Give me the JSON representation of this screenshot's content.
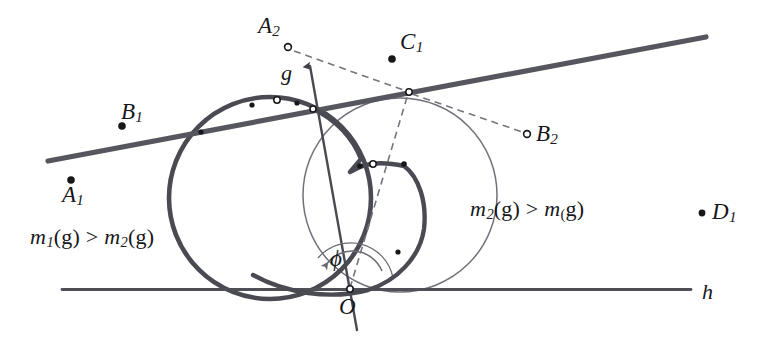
{
  "figure": {
    "kind": "geometry-diagram",
    "width": 776,
    "height": 343,
    "background_color": "#ffffff",
    "ink_color": "#3f3f46",
    "ink_color_dark": "#17171a",
    "thin_color": "#6b6b73"
  },
  "labels": {
    "A1": "A",
    "A1_sub": "1",
    "A2": "A",
    "A2_sub": "2",
    "B1": "B",
    "B1_sub": "1",
    "B2": "B",
    "B2_sub": "2",
    "C1": "C",
    "C1_sub": "1",
    "D1": "D",
    "D1_sub": "1",
    "O": "O",
    "g": "g",
    "h": "h",
    "phi": "ϕ"
  },
  "formulas": {
    "left": {
      "m": "m",
      "sub1": "1",
      "arg1": "(g)",
      "rel": " > ",
      "m2": "m",
      "sub2": "2",
      "arg2": "(g)",
      "full_text": "m₁(g) > m₂(g)"
    },
    "right": {
      "m": "m",
      "sub1": "2",
      "arg1": "(g)",
      "rel": " > ",
      "m2": "m",
      "sub2": "(",
      "arg2": "g)",
      "full_text": "m₂(g) > m₍(g)"
    }
  },
  "points": {
    "A1": {
      "x": 71,
      "y": 180,
      "marker": "filled"
    },
    "A2": {
      "x": 288,
      "y": 46,
      "marker": "open"
    },
    "B1": {
      "x": 124,
      "y": 126,
      "marker": "filled"
    },
    "B2": {
      "x": 538,
      "y": 137,
      "marker": "open"
    },
    "C1": {
      "x": 392,
      "y": 60,
      "marker": "filled"
    },
    "D1": {
      "x": 709,
      "y": 214,
      "marker": "filled"
    },
    "O": {
      "x": 350,
      "y": 290,
      "marker": "open"
    },
    "vertex": {
      "x": 313,
      "y": 109,
      "marker": "open"
    },
    "g_on_circle": {
      "x": 408,
      "y": 92,
      "marker": "open"
    }
  },
  "lines": {
    "g": {
      "x1": 48,
      "y1": 161,
      "x2": 706,
      "y2": 37,
      "label": "g",
      "weight": "thick"
    },
    "h": {
      "x1": 62,
      "y1": 289,
      "x2": 691,
      "y2": 289,
      "label": "h",
      "weight": "medium"
    },
    "axis": {
      "x1": 309,
      "y1": 64,
      "x2": 357,
      "y2": 330,
      "label": "g",
      "weight": "medium",
      "arrow": "up"
    }
  },
  "circles": {
    "left_thick": {
      "cx": 270,
      "cy": 198,
      "r": 101,
      "weight": "thick"
    },
    "right_thin": {
      "cx": 400,
      "cy": 195,
      "r": 97,
      "weight": "thin"
    }
  },
  "angle": {
    "name": "ϕ",
    "vertex": "O",
    "label_x": 336,
    "label_y": 252
  }
}
